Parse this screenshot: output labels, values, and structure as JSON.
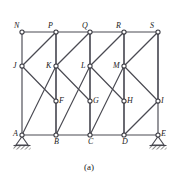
{
  "figure": {
    "caption": "(a)",
    "type": "truss-frame-structural-diagram",
    "colors": {
      "member": "#4a4a52",
      "node_stroke": "#3a3a42",
      "node_fill": "#ffffff",
      "label": "#1a1a1a",
      "hatch": "#2b2b2b"
    }
  },
  "geometry": {
    "columns_x": [
      22,
      56,
      90,
      124,
      158
    ],
    "rows_y": {
      "top": 32,
      "upper_mid": 66,
      "lower_mid": 101,
      "bottom": 135
    }
  },
  "nodes": [
    {
      "id": "N",
      "label": "N",
      "x": 22,
      "y": 32,
      "label_dx": -8,
      "label_dy": -10
    },
    {
      "id": "P",
      "label": "P",
      "x": 56,
      "y": 32,
      "label_dx": -8,
      "label_dy": -10
    },
    {
      "id": "Q",
      "label": "Q",
      "x": 90,
      "y": 32,
      "label_dx": -8,
      "label_dy": -10
    },
    {
      "id": "R",
      "label": "R",
      "x": 124,
      "y": 32,
      "label_dx": -8,
      "label_dy": -10
    },
    {
      "id": "S",
      "label": "S",
      "x": 158,
      "y": 32,
      "label_dx": -8,
      "label_dy": -10
    },
    {
      "id": "J",
      "label": "J",
      "x": 22,
      "y": 66,
      "label_dx": -9,
      "label_dy": -4
    },
    {
      "id": "K",
      "label": "K",
      "x": 56,
      "y": 66,
      "label_dx": -10,
      "label_dy": -4
    },
    {
      "id": "L",
      "label": "L",
      "x": 90,
      "y": 66,
      "label_dx": -9,
      "label_dy": -4
    },
    {
      "id": "M",
      "label": "M",
      "x": 124,
      "y": 66,
      "label_dx": -11,
      "label_dy": -4
    },
    {
      "id": "F",
      "label": "F",
      "x": 56,
      "y": 101,
      "label_dx": 3,
      "label_dy": -4
    },
    {
      "id": "G",
      "label": "G",
      "x": 90,
      "y": 101,
      "label_dx": 3,
      "label_dy": -4
    },
    {
      "id": "H",
      "label": "H",
      "x": 124,
      "y": 101,
      "label_dx": 3,
      "label_dy": -4
    },
    {
      "id": "I",
      "label": "I",
      "x": 158,
      "y": 101,
      "label_dx": 3,
      "label_dy": -4
    },
    {
      "id": "A",
      "label": "A",
      "x": 22,
      "y": 135,
      "label_dx": -9,
      "label_dy": -5
    },
    {
      "id": "B",
      "label": "B",
      "x": 56,
      "y": 135,
      "label_dx": -2,
      "label_dy": 3
    },
    {
      "id": "C",
      "label": "C",
      "x": 90,
      "y": 135,
      "label_dx": -2,
      "label_dy": 3
    },
    {
      "id": "D",
      "label": "D",
      "x": 124,
      "y": 135,
      "label_dx": -2,
      "label_dy": 3
    },
    {
      "id": "E",
      "label": "E",
      "x": 158,
      "y": 135,
      "label_dx": 3,
      "label_dy": -5
    }
  ],
  "members": {
    "chords": [
      {
        "from": "N",
        "to": "P"
      },
      {
        "from": "P",
        "to": "Q"
      },
      {
        "from": "Q",
        "to": "R"
      },
      {
        "from": "R",
        "to": "S"
      },
      {
        "from": "A",
        "to": "B"
      },
      {
        "from": "B",
        "to": "C"
      },
      {
        "from": "C",
        "to": "D"
      },
      {
        "from": "D",
        "to": "E"
      }
    ],
    "columns": [
      {
        "from": "N",
        "to": "A"
      },
      {
        "from": "P",
        "to": "B"
      },
      {
        "from": "Q",
        "to": "C"
      },
      {
        "from": "R",
        "to": "D"
      },
      {
        "from": "S",
        "to": "E"
      }
    ],
    "diagonals": [
      {
        "from": "A",
        "to": "K"
      },
      {
        "from": "J",
        "to": "P"
      },
      {
        "from": "J",
        "to": "F"
      },
      {
        "from": "F",
        "to": "P"
      },
      {
        "from": "B",
        "to": "F"
      },
      {
        "from": "B",
        "to": "L"
      },
      {
        "from": "K",
        "to": "Q"
      },
      {
        "from": "K",
        "to": "G"
      },
      {
        "from": "G",
        "to": "Q"
      },
      {
        "from": "C",
        "to": "G"
      },
      {
        "from": "C",
        "to": "M"
      },
      {
        "from": "L",
        "to": "R"
      },
      {
        "from": "L",
        "to": "H"
      },
      {
        "from": "H",
        "to": "R"
      },
      {
        "from": "D",
        "to": "H"
      },
      {
        "from": "M",
        "to": "S"
      },
      {
        "from": "M",
        "to": "I"
      },
      {
        "from": "I",
        "to": "S"
      },
      {
        "from": "D",
        "to": "I"
      }
    ]
  },
  "supports": [
    {
      "at": "A",
      "kind": "pinned-support",
      "x": 22,
      "y": 135
    },
    {
      "at": "E",
      "kind": "pinned-support",
      "x": 158,
      "y": 135
    }
  ]
}
